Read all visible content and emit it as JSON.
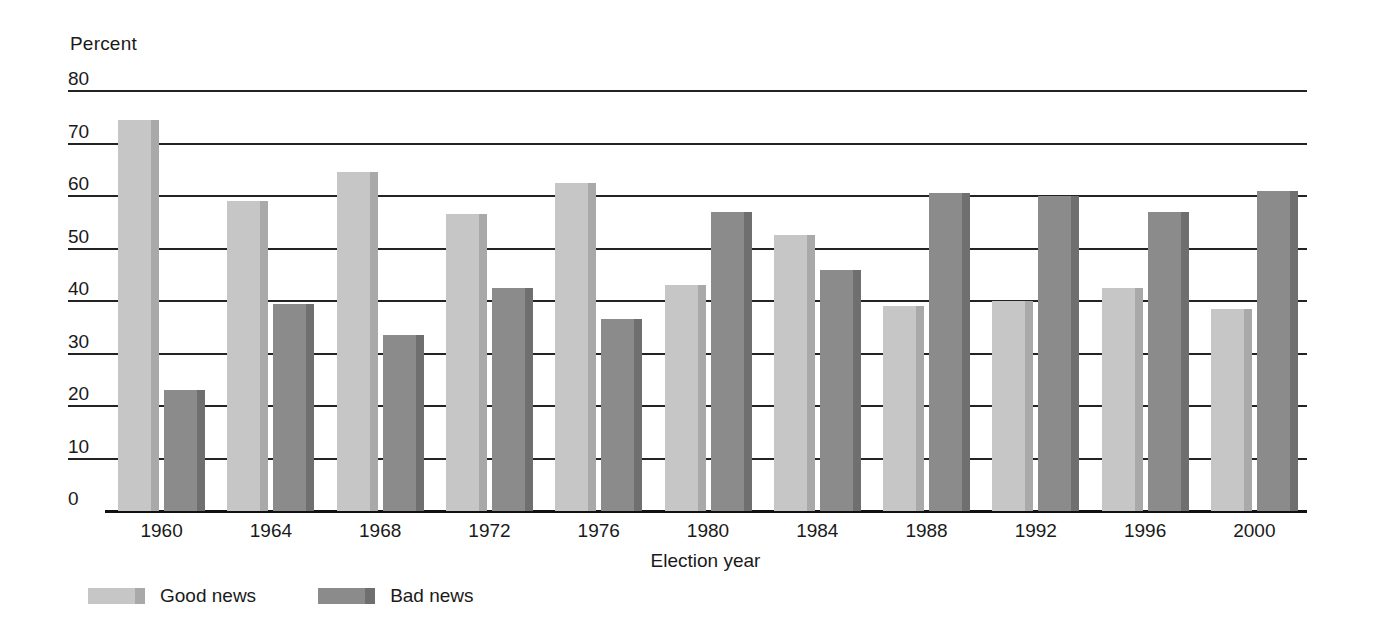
{
  "chart_data": {
    "type": "bar",
    "title": "",
    "xlabel": "Election year",
    "ylabel": "Percent",
    "ylim": [
      0,
      80
    ],
    "yticks": [
      80,
      70,
      60,
      50,
      40,
      30,
      20,
      10,
      0
    ],
    "grid": true,
    "legend_position": "bottom-left",
    "categories": [
      "1960",
      "1964",
      "1968",
      "1972",
      "1976",
      "1980",
      "1984",
      "1988",
      "1992",
      "1996",
      "2000"
    ],
    "series": [
      {
        "name": "Good news",
        "color": "#c6c6c6",
        "shade_color": "#a9a9a9",
        "values": [
          74.5,
          59,
          64.5,
          56.5,
          62.5,
          43,
          52.5,
          39,
          40,
          42.5,
          38.5
        ]
      },
      {
        "name": "Bad news",
        "color": "#8b8b8b",
        "shade_color": "#6f6f6f",
        "values": [
          23,
          39.5,
          33.5,
          42.5,
          36.5,
          57,
          46,
          60.5,
          60,
          57,
          61
        ]
      }
    ]
  },
  "legend": {
    "items": [
      {
        "label": "Good news",
        "key": "good"
      },
      {
        "label": "Bad news",
        "key": "bad"
      }
    ]
  }
}
